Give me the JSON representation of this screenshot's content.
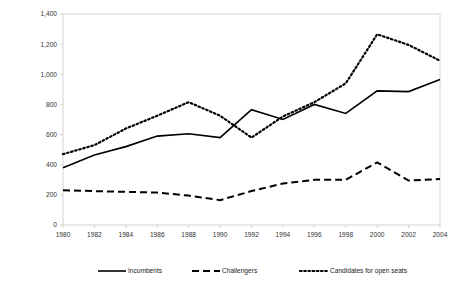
{
  "chart_data": {
    "type": "line",
    "title": "",
    "xlabel": "",
    "ylabel": "Thousands of Dollars, Adjusted for Inflation (2004=1.00)",
    "categories": [
      1980,
      1982,
      1984,
      1986,
      1988,
      1990,
      1992,
      1994,
      1996,
      1998,
      2000,
      2002,
      2004
    ],
    "x_tick_labels": [
      "1980",
      "1982",
      "1984",
      "1986",
      "1988",
      "1990",
      "1992",
      "1994",
      "1996",
      "1998",
      "2000",
      "2002",
      "2004"
    ],
    "y_tick_labels": [
      "0",
      "200",
      "400",
      "600",
      "800",
      "1,000",
      "1,200",
      "1,400"
    ],
    "y_tick_values": [
      0,
      200,
      400,
      600,
      800,
      1000,
      1200,
      1400
    ],
    "ylim": [
      0,
      1400
    ],
    "xlim": [
      1980,
      2004
    ],
    "grid": false,
    "legend_position": "bottom",
    "series": [
      {
        "name": "Incumbents",
        "style": "solid",
        "color": "#000000",
        "values": [
          380,
          465,
          520,
          590,
          605,
          580,
          765,
          700,
          800,
          740,
          890,
          885,
          965
        ]
      },
      {
        "name": "Challengers",
        "style": "dashed",
        "color": "#000000",
        "values": [
          230,
          225,
          220,
          215,
          195,
          165,
          225,
          275,
          300,
          300,
          415,
          295,
          305
        ]
      },
      {
        "name": "Candidates for open seats",
        "style": "dotted",
        "color": "#000000",
        "values": [
          470,
          530,
          640,
          725,
          815,
          725,
          580,
          720,
          815,
          940,
          1265,
          1195,
          1090
        ]
      }
    ]
  },
  "legend": {
    "items": [
      {
        "label": "Incumbents",
        "style": "solid"
      },
      {
        "label": "Challengers",
        "style": "dashed"
      },
      {
        "label": "Candidates for open seats",
        "style": "dotted"
      }
    ]
  },
  "axes": {
    "y_title": "Thousands of Dollars, Adjusted for Inflation (2004=1.00)"
  },
  "colors": {
    "line": "#000000",
    "frame": "#c8c8c8",
    "tick_text": "#333333",
    "background": "#ffffff"
  }
}
